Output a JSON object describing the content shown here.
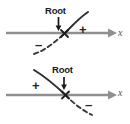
{
  "figure": {
    "name": "root-sign-change-diagram",
    "background": "#ffffff",
    "colors": {
      "axis": "#8f8f8f",
      "curve": "#2f2f2f",
      "text": "#1a1a1a",
      "axis_label": "#555555"
    },
    "panels": [
      {
        "id": "top",
        "description": "Curve rising through the x-axis: negative on the left, positive on the right",
        "root_label": "Root",
        "axis_label": "x",
        "sign_left": "–",
        "sign_right": "+",
        "sign_left_position": "below-left",
        "sign_right_position": "above-right",
        "curve_direction": "increasing",
        "dashed_segment": "lower-left",
        "solid_segment": "upper-right",
        "root_marker": "x-cross"
      },
      {
        "id": "bottom",
        "description": "Curve falling through the x-axis: positive on the left, negative on the right",
        "root_label": "Root",
        "axis_label": "x",
        "sign_left": "+",
        "sign_right": "–",
        "sign_left_position": "above-left",
        "sign_right_position": "below-right",
        "curve_direction": "decreasing",
        "dashed_segment": "lower-right",
        "solid_segment": "upper-left",
        "root_marker": "x-cross"
      }
    ]
  }
}
